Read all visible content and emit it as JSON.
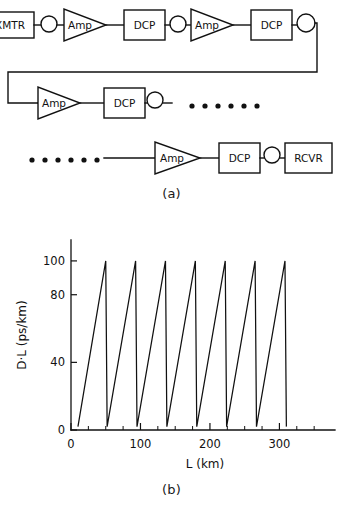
{
  "figure": {
    "panel_a_caption": "(a)",
    "panel_b_caption": "(b)"
  },
  "diagram": {
    "labels": {
      "transmitter": "XMTR",
      "amplifier": "Amp",
      "dispersion_compensator": "DCP",
      "receiver": "RCVR"
    },
    "rows": [
      {
        "row": 1,
        "elements": [
          {
            "kind": "box",
            "label": "XMTR",
            "name": "transmitter-box"
          },
          {
            "kind": "spool",
            "label": "",
            "name": "fiber-spool"
          },
          {
            "kind": "triangle",
            "label": "Amp",
            "name": "amplifier-triangle"
          },
          {
            "kind": "box",
            "label": "DCP",
            "name": "dcp-box"
          },
          {
            "kind": "spool",
            "label": "",
            "name": "fiber-spool"
          },
          {
            "kind": "triangle",
            "label": "Amp",
            "name": "amplifier-triangle"
          },
          {
            "kind": "box",
            "label": "DCP",
            "name": "dcp-box"
          },
          {
            "kind": "spool",
            "label": "",
            "name": "fiber-spool"
          }
        ]
      },
      {
        "row": 2,
        "elements": [
          {
            "kind": "triangle",
            "label": "Amp",
            "name": "amplifier-triangle"
          },
          {
            "kind": "box",
            "label": "DCP",
            "name": "dcp-box"
          },
          {
            "kind": "spool",
            "label": "",
            "name": "fiber-spool"
          },
          {
            "kind": "ellipsis",
            "label": "• • • • • •",
            "name": "ellipsis-dots"
          }
        ]
      },
      {
        "row": 3,
        "elements": [
          {
            "kind": "ellipsis",
            "label": "• • • • • •",
            "name": "ellipsis-dots"
          },
          {
            "kind": "triangle",
            "label": "Amp",
            "name": "amplifier-triangle"
          },
          {
            "kind": "box",
            "label": "DCP",
            "name": "dcp-box"
          },
          {
            "kind": "spool",
            "label": "",
            "name": "fiber-spool"
          },
          {
            "kind": "box",
            "label": "RCVR",
            "name": "receiver-box"
          }
        ]
      }
    ],
    "dots_count": 6,
    "line_color": "#111111"
  },
  "chart_data": {
    "type": "line",
    "title": "",
    "xlabel": "L (km)",
    "ylabel": "D·L (ps/km)",
    "xlim": [
      0,
      380
    ],
    "ylim": [
      0,
      110
    ],
    "grid": false,
    "legend": null,
    "xticks": [
      0,
      100,
      200,
      300
    ],
    "xtick_labels": [
      "0",
      "100",
      "200",
      "300"
    ],
    "xminor_step": 25,
    "yticks": [
      0,
      40,
      80,
      100
    ],
    "ytick_labels": [
      "0",
      "40",
      "80",
      "100"
    ],
    "line_color": "#111111",
    "waveform": "sawtooth",
    "period_km": 43,
    "start_km": 10,
    "peak_value": 100,
    "reset_value": 2,
    "cycles": 7,
    "series": [
      {
        "name": "Accumulated dispersion",
        "x": [
          10,
          50,
          52,
          93,
          95,
          136,
          138,
          179,
          181,
          222,
          224,
          265,
          267,
          308,
          310
        ],
        "y": [
          2,
          100,
          2,
          100,
          2,
          100,
          2,
          100,
          2,
          100,
          2,
          100,
          2,
          100,
          2
        ]
      }
    ]
  }
}
